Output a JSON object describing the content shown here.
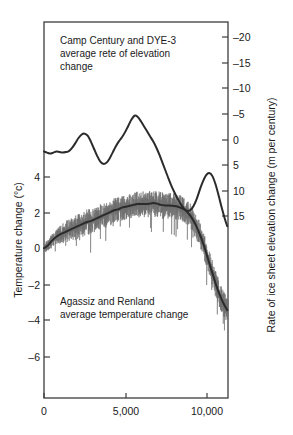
{
  "figure": {
    "background_color": "#ffffff",
    "line_color": "#2b2b2b",
    "noise_color": "#6e6e6e",
    "axis_color": "#3c3c3c"
  },
  "annotations": {
    "elevation": {
      "line1": "Camp Century and DYE-3",
      "line2": "average rete of elevation",
      "line3": "change"
    },
    "temperature": {
      "line1": "Agassiz and Renland",
      "line2": "average temperature change"
    }
  },
  "axes": {
    "left_title": "Temperature change (°c)",
    "right_title": "Rate of ice sheet elevation change (m per century)",
    "bottom_title": "",
    "left_ticks": [
      "4",
      "2",
      "0",
      "–2",
      "–4",
      "–6"
    ],
    "left_tick_values": [
      4,
      2,
      0,
      -2,
      -4,
      -6
    ],
    "right_ticks": [
      "–20",
      "–15",
      "–10",
      "–5",
      "0",
      "5",
      "10",
      "15"
    ],
    "right_tick_values": [
      -20,
      -15,
      -10,
      -5,
      0,
      5,
      10,
      15
    ],
    "bottom_ticks": [
      "0",
      "5,000",
      "10,000"
    ],
    "bottom_tick_values": [
      0,
      5000,
      10000
    ]
  },
  "chart_data": {
    "type": "line",
    "title": "",
    "subtitle": "",
    "xlabel": "",
    "ylabel": "Temperature change (°c)",
    "y2label": "Rate of ice sheet elevation change (m per century)",
    "xlim": [
      0,
      11800
    ],
    "ylim": [
      -7.0,
      5.4
    ],
    "y2lim": [
      -22.5,
      17.5
    ],
    "y2_inverted": true,
    "grid": false,
    "legend": false,
    "annotations": [
      {
        "text": "Camp Century and DYE-3 average rete of elevation change",
        "x": 900,
        "y_axis": "right"
      },
      {
        "text": "Agassiz and Renland average temperature change",
        "x": 900,
        "y_axis": "left",
        "y": -2.2
      }
    ],
    "series": [
      {
        "name": "Camp Century and DYE-3 average rate of elevation change",
        "axis": "right",
        "units": "m per century",
        "style": "smooth-line",
        "x": [
          0,
          200,
          400,
          600,
          800,
          1000,
          1200,
          1400,
          1600,
          1800,
          2000,
          2200,
          2400,
          2600,
          2800,
          3000,
          3200,
          3400,
          3600,
          3800,
          4000,
          4200,
          4400,
          4600,
          4800,
          5000,
          5200,
          5400,
          5600,
          5800,
          6000,
          6200,
          6400,
          6600,
          6800,
          7000,
          7200,
          7400,
          7600,
          7800,
          8000,
          8200,
          8400,
          8600,
          8800,
          9000,
          9200,
          9400,
          9600,
          9800,
          10000,
          10200,
          10400,
          10600,
          10800,
          11000,
          11200,
          11400,
          11600,
          11750
        ],
        "values": [
          2.4,
          2.6,
          2.8,
          2.6,
          2.4,
          2.5,
          2.6,
          2.5,
          2.3,
          1.7,
          0.8,
          -0.2,
          -0.9,
          -1.1,
          -0.7,
          0.4,
          1.8,
          3.2,
          4.3,
          4.8,
          4.6,
          3.8,
          2.6,
          1.4,
          0.4,
          -0.4,
          -1.4,
          -2.6,
          -3.8,
          -4.6,
          -4.4,
          -3.6,
          -2.6,
          -1.6,
          -0.6,
          0.4,
          1.6,
          3.0,
          4.6,
          6.2,
          7.8,
          9.3,
          10.6,
          11.8,
          12.8,
          13.6,
          14.0,
          13.8,
          13.0,
          11.6,
          9.8,
          8.2,
          7.0,
          6.6,
          7.2,
          8.8,
          11.0,
          13.4,
          15.6,
          17.0
        ],
        "peaks": [
          {
            "x": 3800,
            "value": -15.5,
            "note": "largest elevation loss rate"
          },
          {
            "x": 9200,
            "value": -14.0
          }
        ]
      },
      {
        "name": "Agassiz and Renland average temperature change",
        "axis": "left",
        "units": "°C",
        "style": "noisy-line-with-smooth",
        "x": [
          0,
          250,
          500,
          750,
          1000,
          1250,
          1500,
          1750,
          2000,
          2250,
          2500,
          2750,
          3000,
          3250,
          3500,
          3750,
          4000,
          4250,
          4500,
          4750,
          5000,
          5250,
          5500,
          5750,
          6000,
          6250,
          6500,
          6750,
          7000,
          7250,
          7500,
          7750,
          8000,
          8250,
          8500,
          8750,
          9000,
          9250,
          9500,
          9750,
          10000,
          10250,
          10500,
          10750,
          11000,
          11250,
          11500,
          11750
        ],
        "smooth_values": [
          0.05,
          0.2,
          0.45,
          0.65,
          0.8,
          0.9,
          1.0,
          1.1,
          1.2,
          1.3,
          1.4,
          1.5,
          1.55,
          1.65,
          1.75,
          1.85,
          1.95,
          2.05,
          2.15,
          2.2,
          2.3,
          2.35,
          2.4,
          2.45,
          2.5,
          2.5,
          2.5,
          2.52,
          2.55,
          2.52,
          2.45,
          2.42,
          2.42,
          2.4,
          2.38,
          2.3,
          2.2,
          2.0,
          1.7,
          1.3,
          0.8,
          0.2,
          -0.5,
          -1.2,
          -1.9,
          -2.5,
          -3.0,
          -3.4
        ],
        "noise_amplitude": 0.75,
        "noise_description": "high-frequency annual variability drawn as thin grey vertical strokes around the smooth curve"
      }
    ]
  }
}
